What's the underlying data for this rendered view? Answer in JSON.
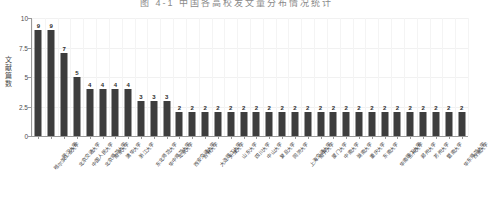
{
  "title": "图 4-1   中国各高校发文量分布情况统计",
  "chart_data": {
    "type": "bar",
    "title": "图 4-1   中国各高校发文量分布情况统计",
    "xlabel": "",
    "ylabel": "文献篇 数",
    "ylim": [
      0,
      10
    ],
    "yticks": [
      0,
      2.5,
      5,
      7.5,
      10
    ],
    "ytick_labels": [
      "0",
      "2.5",
      "5",
      "7.5",
      "10"
    ],
    "grid": true,
    "legend": "none",
    "bar_color": "#3d3d3d",
    "categories": [
      "哈尔滨工业大学",
      "武汉大学",
      "北京交通大学",
      "中国人民大学",
      "北京师范大学",
      "南京大学",
      "清华大学",
      "浙江大学",
      "东北师范大学",
      "华中师范大学",
      "北京大学",
      "西安交通大学",
      "吉林大学",
      "大连理工大学",
      "天津大学",
      "山东大学",
      "四川大学",
      "中山大学",
      "复旦大学",
      "同济大学",
      "上海交通大学",
      "南开大学",
      "厦门大学",
      "中南大学",
      "湖南大学",
      "重庆大学",
      "东南大学",
      "华南理工大学",
      "兰州大学",
      "郑州大学",
      "苏州大学",
      "暨南大学",
      "华东师范大学",
      "西南大学"
    ],
    "values": [
      9,
      9,
      7,
      5,
      4,
      4,
      4,
      4,
      3,
      3,
      3,
      2,
      2,
      2,
      2,
      2,
      2,
      2,
      2,
      2,
      2,
      2,
      2,
      2,
      2,
      2,
      2,
      2,
      2,
      2,
      2,
      2,
      2,
      2
    ],
    "value_labels": [
      "9",
      "9",
      "7",
      "5",
      "4",
      "4",
      "4",
      "4",
      "3",
      "3",
      "3",
      "2",
      "2",
      "2",
      "2",
      "2",
      "2",
      "2",
      "2",
      "2",
      "2",
      "2",
      "2",
      "2",
      "2",
      "2",
      "2",
      "2",
      "2",
      "2",
      "2",
      "2",
      "2",
      "2"
    ]
  }
}
